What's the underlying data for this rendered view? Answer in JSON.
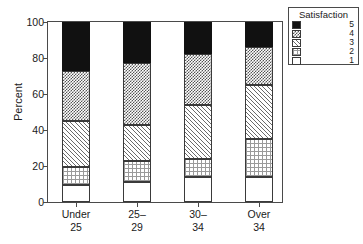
{
  "chart_data": {
    "type": "bar",
    "subtype": "stacked-percent",
    "title": "",
    "xlabel": "",
    "ylabel": "Percent",
    "ylim": [
      0,
      100
    ],
    "yticks": [
      0,
      20,
      40,
      60,
      80,
      100
    ],
    "ytick_labels": [
      "0",
      "20",
      "40",
      "60",
      "80",
      "100"
    ],
    "grid": false,
    "categories": [
      "Under 25",
      "25–29",
      "30–34",
      "Over 34"
    ],
    "category_lines": [
      [
        "Under",
        "25"
      ],
      [
        "25–",
        "29"
      ],
      [
        "30–",
        "34"
      ],
      [
        "Over",
        "34"
      ]
    ],
    "legend": {
      "title": "Satisfaction",
      "position": "right-top",
      "entries": [
        {
          "label": "5",
          "fill": "solid-black"
        },
        {
          "label": "4",
          "fill": "checkerboard"
        },
        {
          "label": "3",
          "fill": "diagonal-hatch"
        },
        {
          "label": "2",
          "fill": "dotted-grid"
        },
        {
          "label": "1",
          "fill": "empty-white"
        }
      ]
    },
    "series": [
      {
        "name": "1",
        "fill": "empty-white",
        "values": [
          9.5,
          11,
          14,
          14
        ]
      },
      {
        "name": "2",
        "fill": "dotted-grid",
        "values": [
          10,
          12,
          10,
          21
        ]
      },
      {
        "name": "3",
        "fill": "diagonal-hatch",
        "values": [
          25.5,
          20,
          30,
          30
        ]
      },
      {
        "name": "4",
        "fill": "checkerboard",
        "values": [
          28,
          34,
          28,
          21
        ]
      },
      {
        "name": "5",
        "fill": "solid-black",
        "values": [
          27,
          23,
          18,
          14
        ]
      }
    ],
    "cumulative_tops": [
      {
        "category": "Under 25",
        "tops": [
          9.5,
          19.5,
          45,
          73,
          100
        ]
      },
      {
        "category": "25–29",
        "tops": [
          11,
          23,
          43,
          77,
          100
        ]
      },
      {
        "category": "30–34",
        "tops": [
          14,
          24,
          54,
          82,
          100
        ]
      },
      {
        "category": "Over 34",
        "tops": [
          14,
          35,
          65,
          86,
          100
        ]
      }
    ]
  }
}
